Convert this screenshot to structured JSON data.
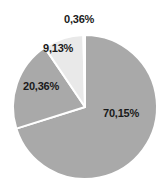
{
  "chart_data": {
    "type": "pie",
    "title": "",
    "subtitle": "",
    "xlabel": "",
    "ylabel": "",
    "legend_position": "none",
    "grid": false,
    "decimal_separator": ",",
    "start_angle_deg": 0,
    "direction": "clockwise",
    "categories": [
      "70,15%",
      "20,36%",
      "9,13%",
      "0,36%"
    ],
    "values": [
      70.15,
      20.36,
      9.13,
      0.36
    ],
    "labels": [
      "70,15%",
      "20,36%",
      "9,13%",
      "0,36%"
    ],
    "slice_colors": [
      "#a9a9a9",
      "#a9a9a9",
      "#e9e9e9",
      "#fdfdfd"
    ],
    "separator_color": "#ffffff",
    "background_color": "#ffffff",
    "label_color": "#1a1a1a",
    "slices": [
      {
        "label": "70,15%",
        "value": 70.15,
        "color": "#a9a9a9"
      },
      {
        "label": "20,36%",
        "value": 20.36,
        "color": "#a9a9a9"
      },
      {
        "label": "9,13%",
        "value": 9.13,
        "color": "#e9e9e9"
      },
      {
        "label": "0,36%",
        "value": 0.36,
        "color": "#fdfdfd"
      }
    ]
  },
  "figure": {
    "name": "pie-chart",
    "labels": {
      "top": "0,36%",
      "upper_left": "9,13%",
      "left": "20,36%",
      "right": "70,15%"
    }
  }
}
